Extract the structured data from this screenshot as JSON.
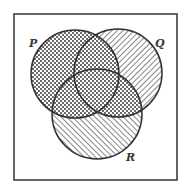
{
  "diagram": {
    "type": "venn",
    "frame": {
      "x": 14,
      "y": 14,
      "width": 163,
      "height": 166,
      "stroke": "#333333"
    },
    "sets": [
      {
        "name": "P",
        "label": "P",
        "cx": 75,
        "cy": 74,
        "r": 44,
        "label_x": 29,
        "label_y": 47
      },
      {
        "name": "Q",
        "label": "Q",
        "cx": 118,
        "cy": 73,
        "r": 44,
        "label_x": 155,
        "label_y": 47
      },
      {
        "name": "R",
        "label": "R",
        "cx": 97,
        "cy": 114,
        "r": 45,
        "label_x": 126,
        "label_y": 161
      }
    ],
    "shading": {
      "P_only": "crosshatch",
      "Q_only": "hatch-forward-diagonal",
      "R_only": "hatch-back-diagonal",
      "P_and_Q": "crosshatch",
      "P_and_R": "crosshatch",
      "Q_and_R": "crosshatch",
      "P_and_Q_and_R": "crosshatch"
    },
    "colors": {
      "stroke": "#333333",
      "hatch": "#555555",
      "background": "#ffffff"
    }
  }
}
